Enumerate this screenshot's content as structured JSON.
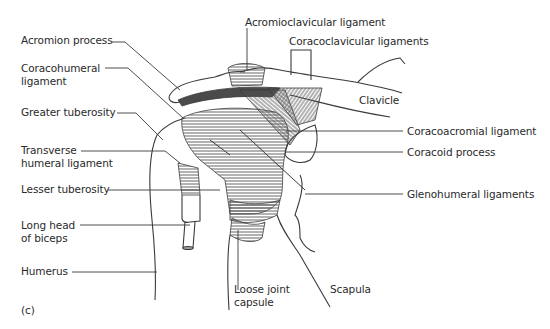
{
  "figure": {
    "panel_label": "(c)",
    "labels": {
      "acromion_process": "Acromion process",
      "coracohumeral_ligament_line1": "Coracohumeral",
      "coracohumeral_ligament_line2": "ligament",
      "greater_tuberosity": "Greater tuberosity",
      "transverse_humeral_ligament_line1": "Transverse",
      "transverse_humeral_ligament_line2": "humeral ligament",
      "lesser_tuberosity": "Lesser tuberosity",
      "long_head_biceps_line1": "Long head",
      "long_head_biceps_line2": "of biceps",
      "humerus": "Humerus",
      "acromioclavicular_ligament": "Acromioclavicular ligament",
      "coracoclavicular_ligaments": "Coracoclavicular ligaments",
      "clavicle": "Clavicle",
      "coracoacromial_ligament": "Coracoacromial ligament",
      "coracoid_process": "Coracoid process",
      "glenohumeral_ligaments": "Glenohumeral ligaments",
      "loose_joint_capsule_line1": "Loose joint",
      "loose_joint_capsule_line2": "capsule",
      "scapula": "Scapula"
    }
  },
  "colors": {
    "line": "#3a3a3a",
    "hatch": "#555555",
    "text": "#2a2a2a",
    "dark_band": "#4a4a4a"
  }
}
